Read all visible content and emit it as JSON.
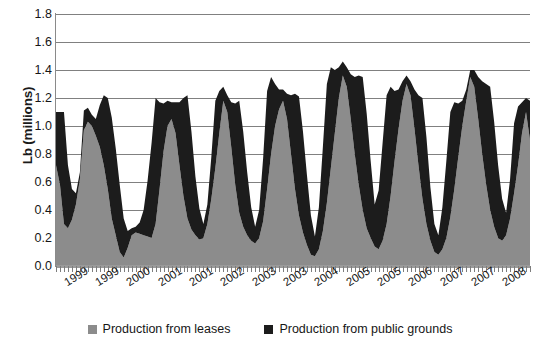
{
  "chart_data": {
    "type": "area",
    "stacked": true,
    "title": "",
    "xlabel": "",
    "ylabel": "Lb (millions)",
    "ylim": [
      0.0,
      1.8
    ],
    "ytick_step": 0.2,
    "ytick_labels": [
      "1.8",
      "1.6",
      "1.4",
      "1.2",
      "1.0",
      "0.8",
      "0.6",
      "0.4",
      "0.2",
      "0.0"
    ],
    "grid": "horizontal",
    "grid_color": "#808080",
    "legend_position": "bottom-center",
    "xtick_labels": [
      "1999",
      "1999",
      "2000",
      "2001",
      "2001",
      "2002",
      "2003",
      "2003",
      "2004",
      "2005",
      "2005",
      "2006",
      "2007",
      "2007",
      "2008"
    ],
    "series": [
      {
        "name": "Production from leases",
        "color": "#8c8c8c",
        "values": [
          0.72,
          0.58,
          0.3,
          0.27,
          0.33,
          0.44,
          0.62,
          0.97,
          1.03,
          1.0,
          0.93,
          0.85,
          0.72,
          0.55,
          0.34,
          0.22,
          0.1,
          0.06,
          0.13,
          0.22,
          0.24,
          0.23,
          0.22,
          0.21,
          0.2,
          0.3,
          0.55,
          0.82,
          1.0,
          1.05,
          0.95,
          0.72,
          0.5,
          0.34,
          0.26,
          0.22,
          0.19,
          0.2,
          0.3,
          0.48,
          0.7,
          0.95,
          1.18,
          1.1,
          0.85,
          0.58,
          0.38,
          0.28,
          0.22,
          0.18,
          0.16,
          0.2,
          0.32,
          0.55,
          0.8,
          1.0,
          1.12,
          1.18,
          1.05,
          0.8,
          0.55,
          0.36,
          0.24,
          0.15,
          0.08,
          0.07,
          0.12,
          0.25,
          0.45,
          0.7,
          0.95,
          1.2,
          1.36,
          1.28,
          1.05,
          0.8,
          0.58,
          0.4,
          0.27,
          0.2,
          0.14,
          0.12,
          0.18,
          0.3,
          0.5,
          0.75,
          0.98,
          1.18,
          1.3,
          1.22,
          0.98,
          0.72,
          0.48,
          0.3,
          0.18,
          0.1,
          0.08,
          0.12,
          0.2,
          0.35,
          0.55,
          0.78,
          1.0,
          1.18,
          1.35,
          1.28,
          1.05,
          0.8,
          0.58,
          0.4,
          0.28,
          0.2,
          0.18,
          0.22,
          0.34,
          0.52,
          0.72,
          0.95,
          1.1,
          0.9
        ]
      },
      {
        "name": "Production from public grounds",
        "color": "#1c1c1c",
        "values": [
          0.38,
          0.52,
          0.8,
          0.45,
          0.22,
          0.08,
          0.05,
          0.14,
          0.1,
          0.08,
          0.12,
          0.3,
          0.5,
          0.65,
          0.72,
          0.62,
          0.48,
          0.28,
          0.12,
          0.05,
          0.04,
          0.08,
          0.18,
          0.4,
          0.68,
          0.9,
          0.62,
          0.34,
          0.18,
          0.12,
          0.22,
          0.45,
          0.7,
          0.88,
          0.7,
          0.42,
          0.22,
          0.1,
          0.14,
          0.3,
          0.48,
          0.3,
          0.1,
          0.12,
          0.32,
          0.58,
          0.8,
          0.68,
          0.45,
          0.24,
          0.12,
          0.2,
          0.45,
          0.7,
          0.55,
          0.3,
          0.14,
          0.08,
          0.18,
          0.42,
          0.68,
          0.85,
          0.72,
          0.5,
          0.28,
          0.14,
          0.3,
          0.6,
          0.85,
          0.72,
          0.45,
          0.22,
          0.1,
          0.14,
          0.32,
          0.55,
          0.78,
          0.95,
          0.82,
          0.55,
          0.3,
          0.42,
          0.7,
          0.92,
          0.78,
          0.5,
          0.28,
          0.14,
          0.06,
          0.1,
          0.28,
          0.5,
          0.72,
          0.62,
          0.38,
          0.2,
          0.14,
          0.3,
          0.55,
          0.75,
          0.62,
          0.38,
          0.18,
          0.08,
          0.05,
          0.12,
          0.3,
          0.52,
          0.72,
          0.88,
          0.75,
          0.52,
          0.3,
          0.16,
          0.28,
          0.5,
          0.42,
          0.22,
          0.1,
          0.28
        ]
      }
    ]
  },
  "axis": {
    "y_title": "Lb (millions)"
  },
  "legend": {
    "entries": [
      {
        "label": "Production from leases",
        "color": "#8c8c8c"
      },
      {
        "label": "Production from public grounds",
        "color": "#1c1c1c"
      }
    ]
  }
}
